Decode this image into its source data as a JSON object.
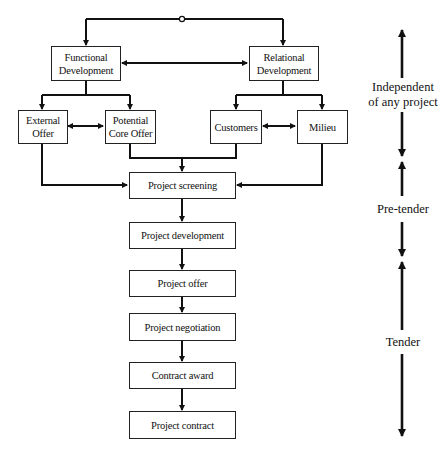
{
  "diagram": {
    "type": "flowchart",
    "nodes": {
      "functional_development": "Functional Development",
      "relational_development": "Relational Development",
      "external_offer": "External Offer",
      "potential_core_offer": "Potential Core Offer",
      "customers": "Customers",
      "milieu": "Milieu",
      "project_screening": "Project screening",
      "project_development": "Project development",
      "project_offer": "Project offer",
      "project_negotiation": "Project negotiation",
      "contract_award": "Contract award",
      "project_contract": "Project contract"
    },
    "node_lines": {
      "functional_development": [
        "Functional",
        "Development"
      ],
      "relational_development": [
        "Relational",
        "Development"
      ],
      "external_offer": [
        "External",
        "Offer"
      ],
      "potential_core_offer": [
        "Potential",
        "Core Offer"
      ]
    },
    "edges": [
      {
        "from": "top-loop",
        "to": "functional_development",
        "type": "arrow"
      },
      {
        "from": "top-loop",
        "to": "relational_development",
        "type": "arrow"
      },
      {
        "from": "functional_development",
        "to": "relational_development",
        "type": "bidirectional"
      },
      {
        "from": "functional_development",
        "to": "external_offer",
        "type": "arrow"
      },
      {
        "from": "functional_development",
        "to": "potential_core_offer",
        "type": "arrow"
      },
      {
        "from": "relational_development",
        "to": "customers",
        "type": "arrow"
      },
      {
        "from": "relational_development",
        "to": "milieu",
        "type": "arrow"
      },
      {
        "from": "external_offer",
        "to": "potential_core_offer",
        "type": "bidirectional"
      },
      {
        "from": "customers",
        "to": "milieu",
        "type": "bidirectional"
      },
      {
        "from": "external_offer",
        "to": "project_screening",
        "type": "arrow"
      },
      {
        "from": "potential_core_offer",
        "to": "project_screening",
        "type": "arrow"
      },
      {
        "from": "customers",
        "to": "project_screening",
        "type": "arrow"
      },
      {
        "from": "milieu",
        "to": "project_screening",
        "type": "arrow"
      },
      {
        "from": "project_screening",
        "to": "project_development",
        "type": "arrow"
      },
      {
        "from": "project_development",
        "to": "project_offer",
        "type": "arrow"
      },
      {
        "from": "project_offer",
        "to": "project_negotiation",
        "type": "arrow"
      },
      {
        "from": "project_negotiation",
        "to": "contract_award",
        "type": "arrow"
      },
      {
        "from": "contract_award",
        "to": "project_contract",
        "type": "arrow"
      }
    ],
    "phases": [
      {
        "label": "Independent of any project",
        "lines": [
          "Independent",
          "of any project"
        ]
      },
      {
        "label": "Pre-tender",
        "lines": [
          "Pre-tender"
        ]
      },
      {
        "label": "Tender",
        "lines": [
          "Tender"
        ]
      }
    ],
    "colors": {
      "line": "#111111",
      "background": "#ffffff",
      "box_border": "#222222"
    }
  }
}
